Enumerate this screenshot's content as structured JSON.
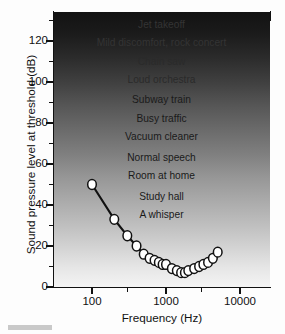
{
  "chart_data": {
    "type": "line",
    "title": "",
    "subtitle": "",
    "xlabel": "Frequency (Hz)",
    "ylabel": "Sound pressure level at threshold (dB)",
    "xscale": "log",
    "yscale": "linear",
    "xlim": [
      60,
      20000
    ],
    "ylim": [
      0,
      130
    ],
    "grid": false,
    "legend": "none",
    "x_ticks": [
      100,
      1000,
      10000
    ],
    "x_tick_labels": [
      "100",
      "1000",
      "10000"
    ],
    "x_minor_ticks": [
      300,
      3000,
      30000
    ],
    "y_ticks": [
      0,
      20,
      40,
      60,
      80,
      100,
      120
    ],
    "y_tick_labels": [
      "0",
      "20",
      "40",
      "60",
      "80",
      "100",
      "120"
    ],
    "y_minor_ticks": [
      10,
      30,
      50,
      70,
      90,
      110,
      130
    ],
    "series": [
      {
        "name": "Threshold of hearing",
        "marker": "open-circle",
        "x": [
          100,
          200,
          300,
          400,
          500,
          600,
          700,
          800,
          900,
          1000,
          1200,
          1400,
          1600,
          1800,
          2000,
          2400,
          2800,
          3200,
          3700,
          4300,
          5000
        ],
        "y": [
          50,
          33,
          25,
          20,
          16,
          14,
          13,
          12,
          11,
          11,
          9,
          8,
          7,
          7,
          8,
          9,
          10,
          11,
          12,
          14,
          17
        ]
      }
    ],
    "annotations": [
      {
        "label": "Jet takeoff",
        "db": 128
      },
      {
        "label": "Mild discomfort, rock concert",
        "db": 119
      },
      {
        "label": "Chain saw",
        "db": 110
      },
      {
        "label": "Loud orchestra",
        "db": 101
      },
      {
        "label": "Subway train",
        "db": 91
      },
      {
        "label": "Busy traffic",
        "db": 82
      },
      {
        "label": "Vacuum cleaner",
        "db": 73
      },
      {
        "label": "Normal speech",
        "db": 63
      },
      {
        "label": "Room at home",
        "db": 54
      },
      {
        "label": "Study hall",
        "db": 44
      },
      {
        "label": "A whisper",
        "db": 35
      }
    ],
    "colors": {
      "marker_fill": "#ffffff",
      "marker_edge": "#111111",
      "line": "#111111",
      "axis": "#111111",
      "background_top": "#121212",
      "background_bottom": "#f4f4f4"
    }
  }
}
